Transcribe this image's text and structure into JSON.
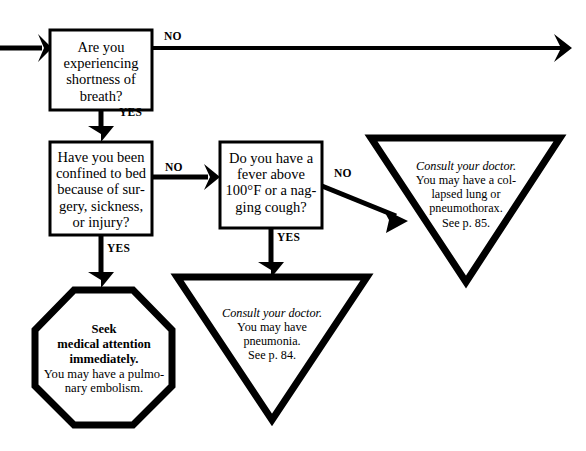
{
  "diagram": {
    "ink_color": "#000000",
    "background_color": "#ffffff",
    "nodes": {
      "question_breath": {
        "shape": "rectangle",
        "lines": [
          "Are you",
          "experiencing",
          "shortness of",
          "breath?"
        ]
      },
      "question_bedrest": {
        "shape": "rectangle",
        "lines": [
          "Have you been",
          "confined to bed",
          "because of sur-",
          "gery, sickness,",
          "or injury?"
        ]
      },
      "question_fever": {
        "shape": "rectangle",
        "lines": [
          "Do you have a",
          "fever above",
          "100°F or a nag-",
          "ging cough?"
        ]
      },
      "outcome_pneumothorax": {
        "shape": "inverted-triangle",
        "emphasis_line": "Consult your doctor.",
        "lines": [
          "You may have a col-",
          "lapsed lung or",
          "pneumothorax.",
          "See p. 85."
        ]
      },
      "outcome_pneumonia": {
        "shape": "inverted-triangle",
        "emphasis_line": "Consult your doctor.",
        "lines": [
          "You may have",
          "pneumonia.",
          "See p. 84."
        ]
      },
      "outcome_embolism": {
        "shape": "octagon",
        "bold_lines": [
          "Seek",
          "medical attention",
          "immediately."
        ],
        "lines": [
          "You may have a pulmo-",
          "nary embolism."
        ]
      }
    },
    "edges": [
      {
        "id": "entry",
        "label": "",
        "from": "page-edge-left",
        "to": "question_breath"
      },
      {
        "id": "breath-no",
        "label": "NO",
        "from": "question_breath",
        "to": "page-edge-right"
      },
      {
        "id": "breath-yes",
        "label": "YES",
        "from": "question_breath",
        "to": "question_bedrest"
      },
      {
        "id": "bedrest-no",
        "label": "NO",
        "from": "question_bedrest",
        "to": "question_fever"
      },
      {
        "id": "bedrest-yes",
        "label": "YES",
        "from": "question_bedrest",
        "to": "outcome_embolism"
      },
      {
        "id": "fever-no",
        "label": "NO",
        "from": "question_fever",
        "to": "outcome_pneumothorax"
      },
      {
        "id": "fever-yes",
        "label": "YES",
        "from": "question_fever",
        "to": "outcome_pneumonia"
      }
    ]
  }
}
